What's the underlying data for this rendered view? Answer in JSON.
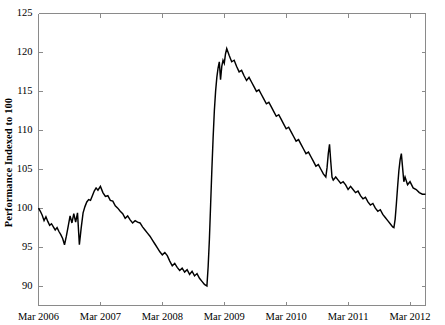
{
  "chart_data": {
    "type": "line",
    "title": "",
    "subtitle": "",
    "xlabel": "",
    "ylabel": "Performance Indexed to 100",
    "ylim": [
      87.5,
      125
    ],
    "xlim": [
      2006.0,
      2012.25
    ],
    "grid": false,
    "legend": null,
    "yticks": [
      90,
      95,
      100,
      105,
      110,
      115,
      120,
      125
    ],
    "ytick_labels": [
      "90",
      "95",
      "100",
      "105",
      "110",
      "115",
      "120",
      "125"
    ],
    "xticks": [
      2006.0,
      2007.0,
      2008.0,
      2009.0,
      2010.0,
      2011.0,
      2012.0
    ],
    "xtick_labels": [
      "Mar 2006",
      "Mar 2007",
      "Mar 2008",
      "Mar 2009",
      "Mar 2010",
      "Mar 2011",
      "Mar 2012"
    ],
    "line_color": "#000000",
    "axis_color": "#8a8a8a",
    "background_color": "#ffffff",
    "series": [
      {
        "name": "Performance Index",
        "x": [
          2006.0,
          2006.03,
          2006.06,
          2006.09,
          2006.12,
          2006.15,
          2006.18,
          2006.21,
          2006.24,
          2006.27,
          2006.3,
          2006.33,
          2006.36,
          2006.39,
          2006.42,
          2006.45,
          2006.48,
          2006.51,
          2006.54,
          2006.57,
          2006.6,
          2006.63,
          2006.66,
          2006.69,
          2006.72,
          2006.75,
          2006.78,
          2006.81,
          2006.84,
          2006.87,
          2006.9,
          2006.93,
          2006.96,
          2007.0,
          2007.04,
          2007.08,
          2007.12,
          2007.16,
          2007.2,
          2007.24,
          2007.28,
          2007.32,
          2007.36,
          2007.4,
          2007.44,
          2007.48,
          2007.52,
          2007.56,
          2007.6,
          2007.64,
          2007.68,
          2007.72,
          2007.76,
          2007.8,
          2007.84,
          2007.88,
          2007.92,
          2007.96,
          2008.0,
          2008.04,
          2008.08,
          2008.12,
          2008.16,
          2008.2,
          2008.24,
          2008.28,
          2008.32,
          2008.36,
          2008.4,
          2008.44,
          2008.48,
          2008.52,
          2008.56,
          2008.6,
          2008.64,
          2008.68,
          2008.72,
          2008.74,
          2008.76,
          2008.78,
          2008.8,
          2008.82,
          2008.84,
          2008.86,
          2008.88,
          2008.9,
          2008.92,
          2008.94,
          2008.96,
          2008.98,
          2009.0,
          2009.02,
          2009.04,
          2009.08,
          2009.12,
          2009.16,
          2009.2,
          2009.24,
          2009.28,
          2009.32,
          2009.36,
          2009.4,
          2009.44,
          2009.48,
          2009.52,
          2009.56,
          2009.6,
          2009.64,
          2009.68,
          2009.72,
          2009.76,
          2009.8,
          2009.84,
          2009.88,
          2009.92,
          2009.96,
          2010.0,
          2010.04,
          2010.08,
          2010.12,
          2010.16,
          2010.2,
          2010.24,
          2010.28,
          2010.32,
          2010.36,
          2010.4,
          2010.44,
          2010.48,
          2010.52,
          2010.56,
          2010.6,
          2010.64,
          2010.66,
          2010.68,
          2010.7,
          2010.72,
          2010.74,
          2010.76,
          2010.8,
          2010.84,
          2010.88,
          2010.92,
          2010.96,
          2011.0,
          2011.04,
          2011.08,
          2011.12,
          2011.16,
          2011.2,
          2011.24,
          2011.28,
          2011.32,
          2011.36,
          2011.4,
          2011.44,
          2011.48,
          2011.52,
          2011.56,
          2011.6,
          2011.64,
          2011.68,
          2011.72,
          2011.74,
          2011.76,
          2011.78,
          2011.8,
          2011.82,
          2011.84,
          2011.86,
          2011.88,
          2011.9,
          2011.92,
          2011.96,
          2012.0,
          2012.05,
          2012.1,
          2012.15,
          2012.2,
          2012.25
        ],
        "y": [
          100.0,
          99.6,
          99.1,
          98.4,
          98.9,
          98.3,
          97.8,
          98.0,
          97.6,
          97.2,
          97.5,
          97.0,
          96.6,
          96.1,
          95.3,
          96.4,
          97.7,
          99.0,
          98.1,
          99.3,
          98.2,
          99.4,
          95.3,
          97.5,
          99.4,
          100.2,
          100.8,
          101.1,
          101.0,
          101.6,
          102.2,
          102.6,
          102.3,
          102.8,
          102.0,
          101.5,
          101.6,
          101.0,
          100.9,
          100.3,
          100.0,
          99.6,
          99.3,
          98.7,
          99.0,
          98.5,
          98.1,
          98.4,
          98.2,
          98.1,
          97.6,
          97.2,
          96.8,
          96.4,
          95.9,
          95.4,
          94.9,
          94.4,
          94.0,
          94.3,
          93.9,
          93.2,
          92.6,
          92.9,
          92.4,
          92.0,
          92.3,
          91.8,
          92.1,
          91.5,
          91.9,
          91.3,
          91.6,
          91.0,
          90.6,
          90.2,
          90.0,
          92.5,
          96.0,
          100.5,
          105.0,
          109.0,
          112.5,
          115.0,
          116.8,
          118.0,
          118.8,
          116.5,
          118.2,
          119.0,
          118.6,
          119.8,
          120.5,
          119.6,
          118.8,
          119.0,
          118.2,
          117.5,
          117.7,
          117.0,
          116.4,
          116.8,
          116.2,
          115.6,
          115.0,
          115.2,
          114.6,
          114.0,
          113.4,
          113.6,
          113.0,
          112.4,
          111.8,
          112.0,
          111.4,
          110.8,
          110.2,
          110.4,
          109.8,
          109.2,
          108.6,
          108.8,
          108.2,
          107.6,
          107.0,
          107.2,
          106.6,
          106.0,
          105.4,
          105.6,
          105.0,
          104.4,
          104.0,
          105.2,
          107.0,
          108.2,
          106.0,
          104.0,
          103.6,
          104.0,
          103.6,
          103.2,
          103.4,
          103.0,
          102.4,
          102.8,
          102.4,
          102.0,
          102.2,
          101.6,
          101.2,
          101.4,
          100.8,
          100.4,
          100.6,
          100.0,
          99.6,
          99.8,
          99.2,
          98.8,
          98.4,
          98.0,
          97.6,
          97.5,
          98.6,
          100.6,
          102.8,
          104.8,
          106.2,
          107.0,
          105.2,
          103.4,
          104.0,
          103.0,
          103.4,
          102.6,
          102.4,
          102.0,
          101.8,
          101.8
        ]
      }
    ]
  },
  "axis": {
    "ylabel_text": "Performance Indexed to 100"
  }
}
